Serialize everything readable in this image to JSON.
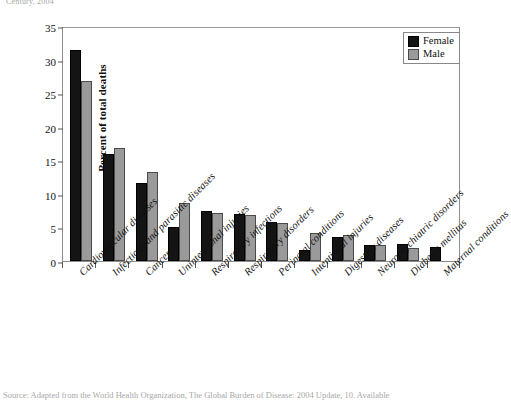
{
  "figure": {
    "top_caption": "Century, 2004",
    "source_caption": "Source: Adapted from the World Health Organization, The Global Burden of Disease: 2004 Update, 10. Available"
  },
  "legend": {
    "position": "top-right",
    "entries": [
      {
        "label": "Female",
        "color": "#141414"
      },
      {
        "label": "Male",
        "color": "#9a9a9a"
      }
    ]
  },
  "chart_data": {
    "type": "bar",
    "title": "",
    "xlabel": "",
    "ylabel": "Percent of total deaths",
    "ylim": [
      0,
      35
    ],
    "yticks": [
      0,
      5,
      10,
      15,
      20,
      25,
      30,
      35
    ],
    "grid": false,
    "legend_position": "top-right",
    "categories": [
      "Cardiovascular diseases",
      "Infectious and parasitic diseases",
      "Cancers",
      "Unintentional injuries",
      "Respiratory infections",
      "Respiratory disorders",
      "Perinatal conditions",
      "Intentional injuries",
      "Digestive diseases",
      "Neuropsychiatric disorders",
      "Diabetes mellitus",
      "Maternal conditions"
    ],
    "series": [
      {
        "name": "Female",
        "color": "#141414",
        "values": [
          31.5,
          15.9,
          11.6,
          5.0,
          7.5,
          7.0,
          5.8,
          1.7,
          3.6,
          2.4,
          2.5,
          2.1
        ]
      },
      {
        "name": "Male",
        "color": "#9a9a9a",
        "values": [
          26.8,
          16.9,
          13.3,
          8.6,
          7.2,
          6.9,
          5.6,
          4.1,
          3.9,
          2.4,
          1.9,
          null
        ]
      }
    ]
  }
}
